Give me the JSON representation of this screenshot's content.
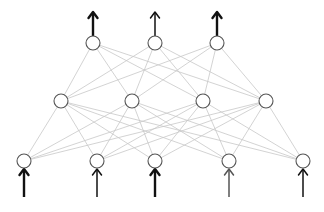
{
  "diagram": {
    "type": "feedforward-neural-network",
    "colors": {
      "background": "#ffffff",
      "node_stroke": "#555555",
      "node_fill": "#ffffff",
      "edge": "#c8c8c8",
      "arrow_bold": "#111111",
      "arrow_light": "#555555"
    },
    "node_radius": 7,
    "layers": [
      {
        "name": "output",
        "nodes": [
          {
            "x": 93,
            "y": 43,
            "arrow": "bold"
          },
          {
            "x": 155,
            "y": 43,
            "arrow": "normal"
          },
          {
            "x": 217,
            "y": 43,
            "arrow": "bold"
          }
        ]
      },
      {
        "name": "hidden",
        "nodes": [
          {
            "x": 61,
            "y": 101
          },
          {
            "x": 132,
            "y": 101
          },
          {
            "x": 203,
            "y": 101
          },
          {
            "x": 266,
            "y": 101
          }
        ]
      },
      {
        "name": "input",
        "nodes": [
          {
            "x": 24,
            "y": 161,
            "arrow": "bold"
          },
          {
            "x": 97,
            "y": 161,
            "arrow": "normal"
          },
          {
            "x": 155,
            "y": 161,
            "arrow": "bold"
          },
          {
            "x": 229,
            "y": 161,
            "arrow": "light"
          },
          {
            "x": 303,
            "y": 161,
            "arrow": "normal"
          }
        ]
      }
    ],
    "output_arrow": {
      "from_offset": 7,
      "to_y": 12
    },
    "input_arrow": {
      "from_y": 197,
      "to_offset": 8
    }
  }
}
